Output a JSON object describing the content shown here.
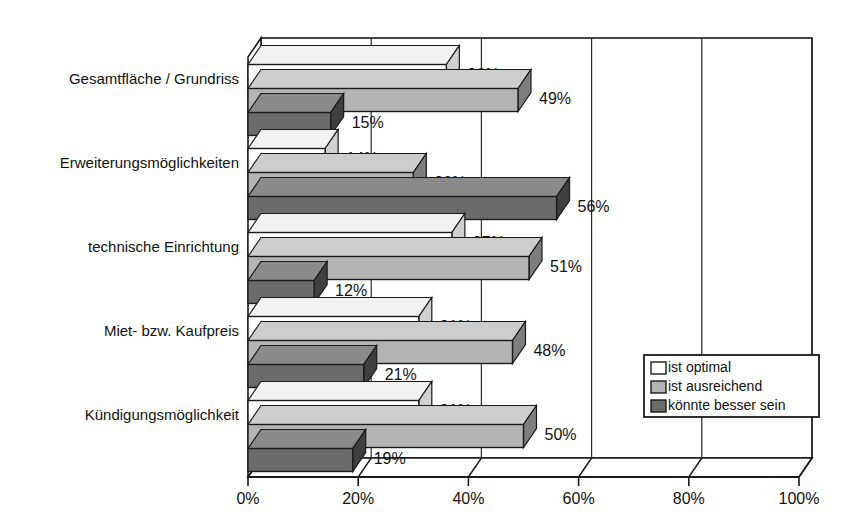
{
  "chart_data": {
    "type": "bar",
    "orientation": "horizontal",
    "style": "3d-grouped-bar",
    "title": "",
    "subtitle": "",
    "xlabel": "",
    "ylabel": "",
    "xlim": [
      0,
      100
    ],
    "xticks": [
      0,
      20,
      40,
      60,
      80,
      100
    ],
    "xtick_labels": [
      "0%",
      "20%",
      "40%",
      "60%",
      "80%",
      "100%"
    ],
    "grid": true,
    "grid_axis": "x",
    "legend_position": "bottom-right",
    "categories": [
      "Gesamtfläche / Grundriss",
      "Erweiterungsmöglichkeiten",
      "technische Einrichtung",
      "Miet- bzw. Kaufpreis",
      "Kündigungsmöglichkeit"
    ],
    "series": [
      {
        "name": "ist optimal",
        "color": "#ffffff",
        "values": [
          36,
          14,
          37,
          31,
          31
        ],
        "value_labels": [
          "36%",
          "14%",
          "37%",
          "31%",
          "31%"
        ]
      },
      {
        "name": "ist ausreichend",
        "color": "#b4b4b4",
        "values": [
          49,
          30,
          51,
          48,
          50
        ],
        "value_labels": [
          "49%",
          "30%",
          "51%",
          "48%",
          "50%"
        ]
      },
      {
        "name": "könnte besser sein",
        "color": "#6b6b6b",
        "values": [
          15,
          56,
          12,
          21,
          19
        ],
        "value_labels": [
          "15%",
          "56%",
          "12%",
          "21%",
          "19%"
        ]
      }
    ]
  },
  "legend": {
    "entries": [
      {
        "label": "ist optimal",
        "swatch": "#ffffff"
      },
      {
        "label": "ist ausreichend",
        "swatch": "#b4b4b4"
      },
      {
        "label": "könnte besser sein",
        "swatch": "#6b6b6b"
      }
    ]
  },
  "colors": {
    "outline": "#1a1a1a",
    "optimal": "#ffffff",
    "ausreichend": "#b4b4b4",
    "besser": "#6b6b6b",
    "side_shade_light": "#8c8c8c",
    "side_shade_dark": "#4a4a4a",
    "side_shade_white": "#d8d8d8",
    "background": "#ffffff"
  }
}
